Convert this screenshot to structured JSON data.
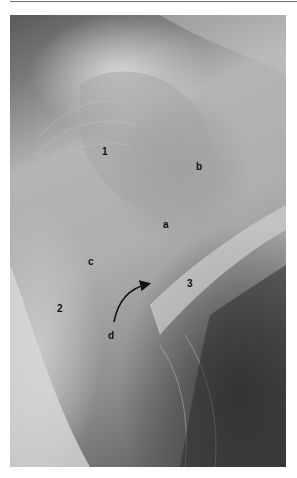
{
  "figure": {
    "labels": [
      {
        "id": "1",
        "text": "1",
        "x": 102,
        "y": 147
      },
      {
        "id": "b",
        "text": "b",
        "x": 196,
        "y": 162
      },
      {
        "id": "a",
        "text": "a",
        "x": 163,
        "y": 220
      },
      {
        "id": "c",
        "text": "c",
        "x": 88,
        "y": 257
      },
      {
        "id": "3",
        "text": "3",
        "x": 187,
        "y": 279
      },
      {
        "id": "2",
        "text": "2",
        "x": 57,
        "y": 304
      },
      {
        "id": "d",
        "text": "d",
        "x": 108,
        "y": 331
      }
    ],
    "arrow": {
      "from": "d",
      "start": [
        114,
        322
      ],
      "end": [
        150,
        284
      ]
    }
  }
}
